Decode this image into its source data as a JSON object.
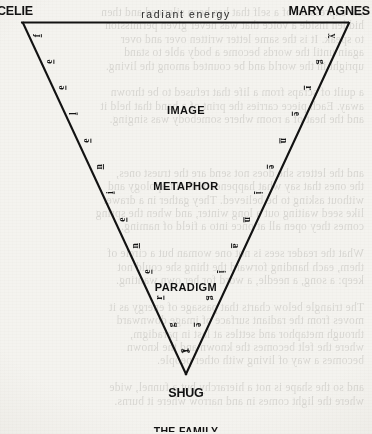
{
  "figure": {
    "top_edge_label": "radiant energy",
    "corners": {
      "top_left": "CELIE",
      "top_right": "MARY AGNES",
      "bottom": "SHUG"
    },
    "inner_labels": [
      "IMAGE",
      "METAPHOR",
      "PARADIGM"
    ],
    "caption": "THE FAMILY",
    "left_edge_label": "feeling energy",
    "right_edge_label": "feeling energy",
    "left_edge_letters": [
      "f",
      "e",
      "e",
      "l",
      "e",
      "n",
      "i",
      "e",
      "n",
      "e",
      "r",
      "g",
      "y"
    ],
    "right_edge_letters": [
      "y",
      "g",
      "r",
      "e",
      "n",
      "e",
      "i",
      "n",
      "a",
      "i",
      "g",
      "e",
      "f"
    ],
    "colors": {
      "ink": "#111111",
      "paper": "#f4f3ef",
      "faint_text": "#1d1a14"
    }
  },
  "background_showthrough": {
    "lines": [
      "the expression of a self that has been silenced and then",
      "hidden inside a voice that was never given permission",
      "to speak. It is the same letter written over and over",
      "again until the words become a body able to stand",
      "upright in the world and be counted among the living.",
      "",
      "a quilt of scraps from a life that refused to be thrown",
      "away. Each piece carries the print of a hand that held it",
      "and the heat of a room where somebody was singing.",
      "",
      "",
      "",
      "and the letters she does not send are the truest ones,",
      "the ones that say what happened without apology and",
      "without asking to be believed. They gather in a drawer",
      "like seed waiting out a long winter, and when the spring",
      "comes they open all at once into a field of naming.",
      "",
      "What the reader sees is not one woman but a circle of",
      "them, each handing forward the thing she could not",
      "keep: a song, a needle, a word for her own wanting.",
      "",
      "The triangle below charts that passage of energy as it",
      "moves from the radiant surface of image downward",
      "through metaphor and settles at last in paradigm,",
      "where the felt becomes the known and the known",
      "becomes a way of living with other people.",
      "",
      "and so the shape is not a hierarchy but a funnel, wide",
      "where the light comes in and narrow where it burns."
    ]
  }
}
